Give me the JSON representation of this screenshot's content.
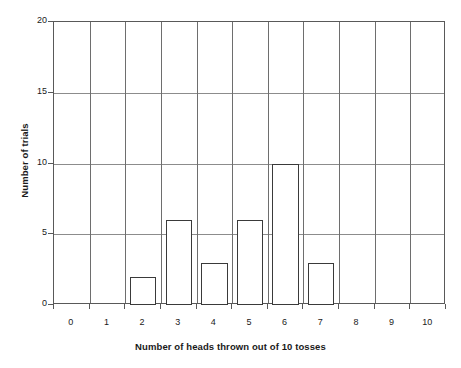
{
  "chart_data": {
    "type": "bar",
    "title": "",
    "xlabel": "Number of heads thrown out of 10 tosses",
    "ylabel": "Number of trials",
    "categories": [
      "0",
      "1",
      "2",
      "3",
      "4",
      "5",
      "6",
      "7",
      "8",
      "9",
      "10"
    ],
    "values": [
      0,
      0,
      2,
      6,
      3,
      6,
      10,
      3,
      0,
      0,
      0
    ],
    "series": [
      {
        "name": "Number of trials",
        "values": [
          0,
          0,
          2,
          6,
          3,
          6,
          10,
          3,
          0,
          0,
          0
        ]
      }
    ],
    "ylim": [
      0,
      20
    ],
    "yticks": [
      0,
      5,
      10,
      15,
      20
    ],
    "ytick_labels": [
      "0",
      "5",
      "10",
      "15",
      "20"
    ],
    "grid": "both",
    "legend": "none",
    "bar_fill_color": "#ffffff",
    "bar_edge_color": "#3a3a3a",
    "gridline_color": "#8c8c8c",
    "axis_color": "#595959",
    "text_color": "#1a1a1a"
  }
}
